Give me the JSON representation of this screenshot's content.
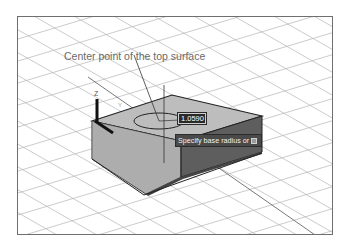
{
  "callout": {
    "text": "Center point of the top surface"
  },
  "ucs": {
    "z_label": "Z",
    "y_label": "Y"
  },
  "dynamic_input": {
    "value": "1.0590"
  },
  "tooltip": {
    "text": "Specify base radius or",
    "options_icon": "down-arrow-icon"
  },
  "colors": {
    "grid": "#b5b5b5",
    "box_top": "#bdbdbd",
    "box_left": "#b3b3b3",
    "box_right": "#5e5e5e",
    "edge": "#222222",
    "tooltip_bg": "#4a4a4a"
  }
}
